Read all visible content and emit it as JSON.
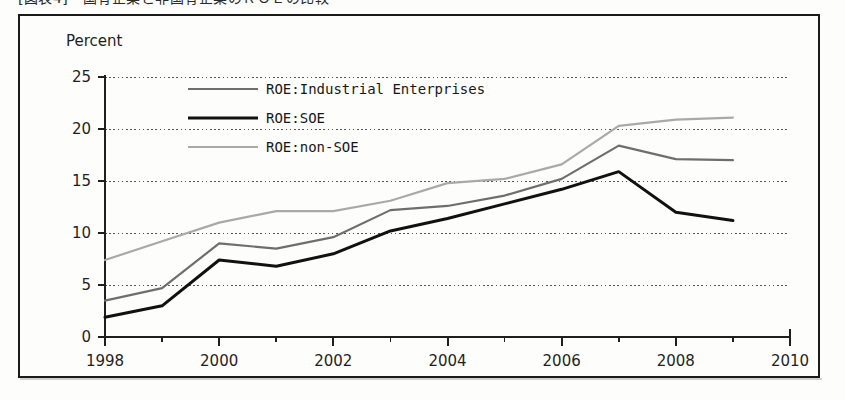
{
  "caption": {
    "text": "[図表4]　国有企業と非国有企業のＲＯＥの比較"
  },
  "colors": {
    "industrial": "#6e6e6e",
    "soe": "#111111",
    "non_soe": "#a9a9a9",
    "axis": "#1f1f1f",
    "grid": "#555555",
    "frame": "#1b1b1b",
    "background": "#fdfdfb"
  },
  "chart_data": {
    "type": "line",
    "title": "",
    "xlabel": "",
    "ylabel": "Percent",
    "unit_label": "Percent",
    "xlim": [
      1998,
      2010
    ],
    "ylim": [
      0,
      25
    ],
    "grid": true,
    "grid_style": "dotted-horizontal",
    "legend_position": "top-center-inside",
    "x": [
      1998,
      1999,
      2000,
      2001,
      2002,
      2003,
      2004,
      2005,
      2006,
      2007,
      2008,
      2009
    ],
    "x_ticks": [
      1998,
      2000,
      2002,
      2004,
      2006,
      2008,
      2010
    ],
    "x_minor_ticks": [
      1999,
      2001,
      2003,
      2005,
      2007,
      2009
    ],
    "y_ticks": [
      0,
      5,
      10,
      15,
      20,
      25
    ],
    "series": [
      {
        "name": "ROE:Industrial Enterprises",
        "color": "#6e6e6e",
        "width": 2.2,
        "values": [
          3.5,
          4.7,
          9.0,
          8.5,
          9.6,
          12.2,
          12.6,
          13.6,
          15.2,
          18.4,
          17.1,
          17.0
        ]
      },
      {
        "name": "ROE:SOE",
        "color": "#111111",
        "width": 3.0,
        "values": [
          1.9,
          3.0,
          7.4,
          6.8,
          8.0,
          10.2,
          11.4,
          12.8,
          14.2,
          15.9,
          12.0,
          11.2
        ]
      },
      {
        "name": "ROE:non-SOE",
        "color": "#a9a9a9",
        "width": 2.2,
        "values": [
          7.4,
          9.2,
          11.0,
          12.1,
          12.1,
          13.1,
          14.8,
          15.2,
          16.6,
          20.3,
          20.9,
          21.1
        ]
      }
    ]
  },
  "legend": {
    "items": [
      {
        "label": "ROE:Industrial Enterprises"
      },
      {
        "label": "ROE:SOE"
      },
      {
        "label": "ROE:non-SOE"
      }
    ]
  }
}
